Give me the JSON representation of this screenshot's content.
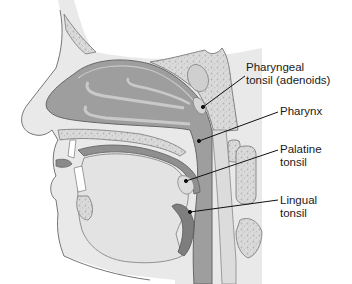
{
  "figure": {
    "colors": {
      "background": "#ffffff",
      "skin": "#e9e9e9",
      "outline": "#6f6f6f",
      "airway": "#9e9e9e",
      "airway_dark": "#8c8c8c",
      "bone": "#dadada",
      "bone_speckle": "#b5b5b5",
      "tissue_light": "#d3d3d3",
      "leader_line": "#111111"
    },
    "labels": [
      {
        "id": "pharyngeal-tonsil",
        "lines": [
          "Pharyngeal",
          "tonsil (adenoids)"
        ],
        "x": 246,
        "y": 61,
        "pointer": {
          "x": 203,
          "y": 107
        }
      },
      {
        "id": "pharynx",
        "lines": [
          "Pharynx"
        ],
        "x": 280,
        "y": 107,
        "pointer": {
          "x": 199,
          "y": 141
        }
      },
      {
        "id": "palatine-tonsil",
        "lines": [
          "Palatine",
          "tonsil"
        ],
        "x": 280,
        "y": 144,
        "pointer": {
          "x": 186,
          "y": 181
        }
      },
      {
        "id": "lingual-tonsil",
        "lines": [
          "Lingual",
          "tonsil"
        ],
        "x": 280,
        "y": 195,
        "pointer": {
          "x": 190,
          "y": 212
        }
      }
    ]
  }
}
